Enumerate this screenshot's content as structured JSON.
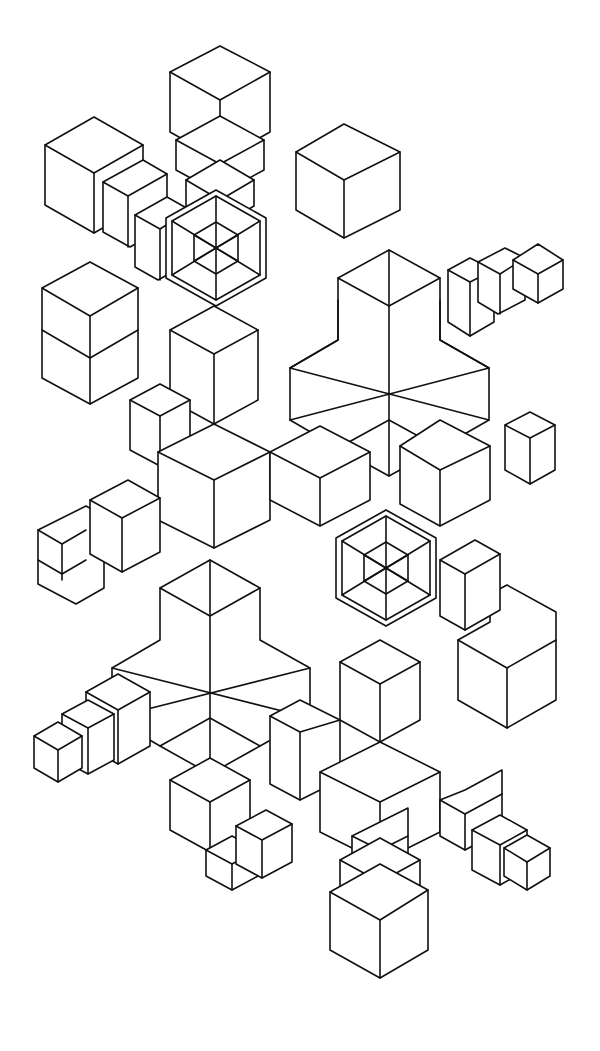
{
  "artwork": {
    "title": "Isometric stepped-cube geometric pattern",
    "style": "black line art on white",
    "colors": {
      "background": "#ffffff",
      "line": "#111111"
    },
    "cores": [
      {
        "name": "upper-hex-core",
        "cx": 216,
        "cy": 247
      },
      {
        "name": "lower-hex-core",
        "cx": 386,
        "cy": 567
      }
    ],
    "large_stars": [
      {
        "name": "upper-right-star",
        "cx": 389,
        "cy": 359
      },
      {
        "name": "lower-left-star",
        "cx": 210,
        "cy": 667
      }
    ],
    "end_cubes": [
      {
        "name": "top-cube",
        "x": 220,
        "y": 46
      },
      {
        "name": "upper-left-cube",
        "x": 94,
        "y": 117
      },
      {
        "name": "upper-right-small-cube",
        "x": 538,
        "y": 244
      },
      {
        "name": "left-small-cube",
        "x": 58,
        "y": 520
      },
      {
        "name": "lower-left-small-cube",
        "x": 58,
        "y": 735
      },
      {
        "name": "lower-right-small-cube",
        "x": 527,
        "y": 835
      },
      {
        "name": "bottom-cube",
        "x": 380,
        "y": 890
      }
    ]
  }
}
